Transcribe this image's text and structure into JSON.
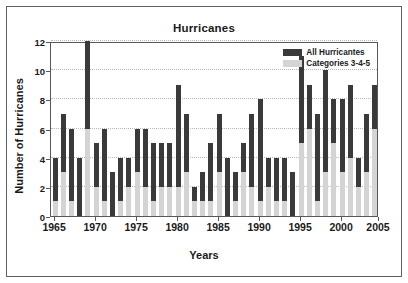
{
  "chart_data": {
    "type": "bar",
    "title": "Hurricanes",
    "xlabel": "Years",
    "ylabel": "Number of Hurricanes",
    "grid": true,
    "legend_position": "top-right",
    "stacked": true,
    "ylim": [
      0,
      12
    ],
    "yticks": [
      0,
      2,
      4,
      6,
      8,
      10,
      12
    ],
    "xlim": [
      1964.5,
      2004.5
    ],
    "xticks": [
      1965,
      1970,
      1975,
      1980,
      1985,
      1990,
      1995,
      2000,
      2005
    ],
    "xtick_labels": [
      "1965",
      "1970",
      "1975",
      "1980",
      "1985",
      "1990",
      "1995",
      "2000",
      "2005"
    ],
    "categories": [
      1965,
      1966,
      1967,
      1968,
      1969,
      1970,
      1971,
      1972,
      1973,
      1974,
      1975,
      1976,
      1977,
      1978,
      1979,
      1980,
      1981,
      1982,
      1983,
      1984,
      1985,
      1986,
      1987,
      1988,
      1989,
      1990,
      1991,
      1992,
      1993,
      1994,
      1995,
      1996,
      1997,
      1998,
      1999,
      2000,
      2001,
      2002,
      2003,
      2004
    ],
    "series": [
      {
        "name": "All Hurricantes",
        "color": "#3a3a3a",
        "values": [
          4,
          7,
          6,
          4,
          12,
          5,
          6,
          3,
          4,
          4,
          6,
          6,
          5,
          5,
          5,
          9,
          7,
          2,
          3,
          5,
          7,
          4,
          3,
          5,
          7,
          8,
          4,
          4,
          4,
          3,
          11,
          9,
          7,
          10,
          8,
          8,
          9,
          4,
          7,
          9
        ]
      },
      {
        "name": "Categories 3-4-5",
        "color": "#d4d4d4",
        "values": [
          1,
          3,
          1,
          0,
          6,
          2,
          1,
          0,
          1,
          2,
          3,
          2,
          1,
          2,
          2,
          2,
          3,
          1,
          1,
          1,
          3,
          0,
          1,
          3,
          2,
          1,
          2,
          1,
          1,
          0,
          5,
          6,
          1,
          3,
          5,
          3,
          4,
          2,
          3,
          6
        ]
      }
    ]
  },
  "legend": {
    "entries": [
      {
        "label": "All Hurricantes",
        "color": "#3a3a3a"
      },
      {
        "label": "Categories 3-4-5",
        "color": "#d4d4d4"
      }
    ]
  }
}
